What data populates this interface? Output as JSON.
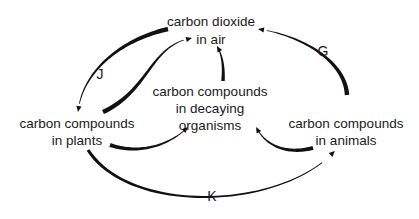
{
  "nodes": [
    {
      "id": "air",
      "lines": [
        "carbon dioxide",
        "in air"
      ]
    },
    {
      "id": "decaying",
      "lines": [
        "carbon compounds",
        "in decaying",
        "organisms"
      ]
    },
    {
      "id": "plants",
      "lines": [
        "carbon compounds",
        "in plants"
      ]
    },
    {
      "id": "animals",
      "lines": [
        "carbon compounds",
        "in animals"
      ]
    }
  ],
  "edges": [
    {
      "id": "J",
      "from": "air",
      "to": "plants",
      "label": "J"
    },
    {
      "id": "photo-return",
      "from": "plants",
      "to": "air",
      "label": ""
    },
    {
      "id": "decay-resp",
      "from": "decaying",
      "to": "air",
      "label": ""
    },
    {
      "id": "G",
      "from": "animals",
      "to": "air",
      "label": "G"
    },
    {
      "id": "plants-decay",
      "from": "plants",
      "to": "decaying",
      "label": ""
    },
    {
      "id": "animals-decay",
      "from": "animals",
      "to": "decaying",
      "label": ""
    },
    {
      "id": "K",
      "from": "plants",
      "to": "animals",
      "label": "K"
    }
  ],
  "colors": {
    "ink": "#111111",
    "background": "#ffffff"
  }
}
